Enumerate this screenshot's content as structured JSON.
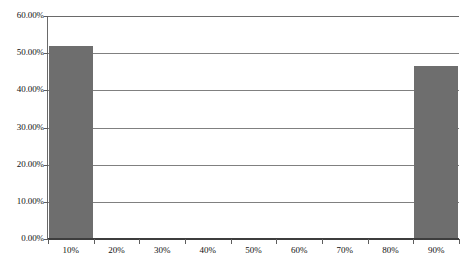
{
  "chart_data": {
    "type": "bar",
    "title": "",
    "subtitle": "",
    "xlabel": "",
    "ylabel": "",
    "categories": [
      "10%",
      "20%",
      "30%",
      "40%",
      "50%",
      "60%",
      "70%",
      "80%",
      "90%"
    ],
    "values": [
      52.0,
      0,
      0,
      0,
      0,
      0,
      0,
      0,
      46.5
    ],
    "ylim": [
      0,
      60
    ],
    "ytick_values": [
      0,
      10,
      20,
      30,
      40,
      50,
      60
    ],
    "ytick_labels": [
      "0.00%",
      "10.00%",
      "20.00%",
      "30.00%",
      "40.00%",
      "50.00%",
      "60.00%"
    ],
    "grid": true,
    "grid_axis": "y",
    "legend": false,
    "legend_position": "none",
    "annotations": [],
    "series": [
      {
        "name": "Series 1",
        "values": [
          52.0,
          0,
          0,
          0,
          0,
          0,
          0,
          0,
          46.5
        ]
      }
    ],
    "colors": {
      "bar_fill": "#6e6e6e",
      "gridline": "#808080",
      "axis_line": "#3d3d3d",
      "background": "#ffffff",
      "text": "#111111"
    }
  }
}
